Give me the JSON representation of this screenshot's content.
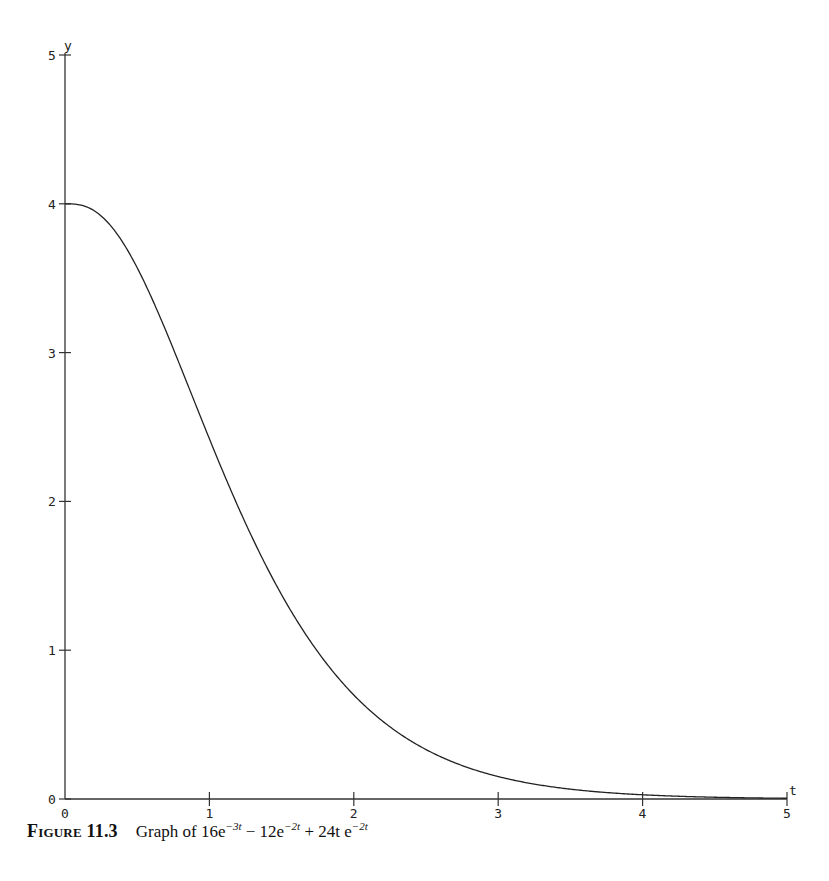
{
  "chart_data": {
    "type": "line",
    "title": "",
    "xlabel": "t",
    "ylabel": "y",
    "xlim": [
      0,
      5
    ],
    "ylim": [
      0,
      5
    ],
    "x_ticks": [
      "0",
      "1",
      "2",
      "3",
      "4",
      "5"
    ],
    "y_ticks": [
      "0",
      "1",
      "2",
      "3",
      "4",
      "5"
    ],
    "grid": false,
    "legend": null,
    "function": "16e^{-3t} - 12e^{-2t} + 24te^{-2t}",
    "series": [
      {
        "name": "16e^{-3t} - 12e^{-2t} + 24te^{-2t}",
        "x": [
          0,
          0.25,
          0.5,
          0.75,
          1,
          1.25,
          1.5,
          1.75,
          2,
          2.5,
          3,
          3.5,
          4,
          4.5,
          5
        ],
        "values": [
          4.0,
          3.86,
          3.35,
          2.72,
          2.13,
          1.62,
          1.2,
          0.88,
          0.63,
          0.31,
          0.14,
          0.07,
          0.03,
          0.01,
          0.0
        ]
      }
    ]
  },
  "caption": {
    "figure_label": "Figure 11.3",
    "text": "Graph of",
    "term1_coef": "16e",
    "term1_exp": "−3t",
    "op1": " − 12e",
    "term2_exp": "−2t",
    "op2": " + 24t e",
    "term3_exp": "−2t"
  }
}
